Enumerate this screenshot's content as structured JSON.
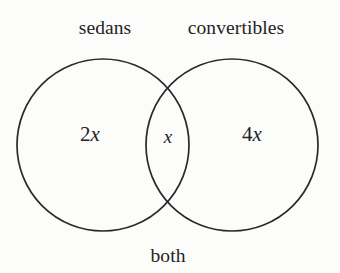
{
  "figure": {
    "type": "venn-diagram",
    "background_color": "#fcfcfb",
    "stroke_color": "#2a2a2a",
    "text_color": "#232323",
    "set_labels": {
      "left": "sedans",
      "right": "convertibles",
      "bottom": "both"
    },
    "regions": {
      "left_only": {
        "coefficient": "2",
        "variable": "x",
        "text": "2x"
      },
      "intersection": {
        "coefficient": "",
        "variable": "x",
        "text": "x"
      },
      "right_only": {
        "coefficient": "4",
        "variable": "x",
        "text": "4x"
      }
    },
    "circles": [
      {
        "name": "sedans-circle",
        "cx": 103,
        "cy": 145,
        "r": 86
      },
      {
        "name": "convertibles-circle",
        "cx": 232,
        "cy": 145,
        "r": 86
      }
    ]
  }
}
